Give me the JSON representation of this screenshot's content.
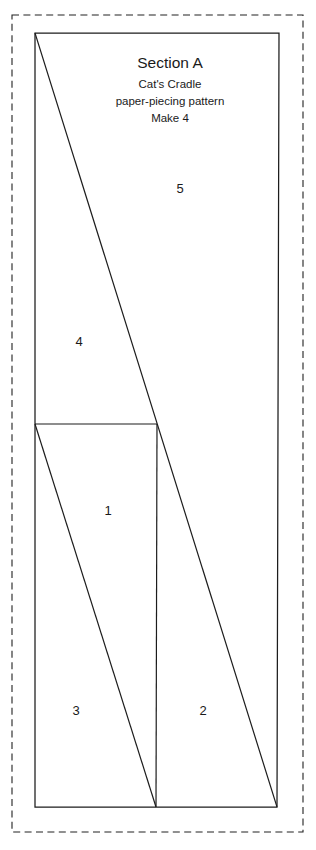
{
  "sheet": {
    "width": 316,
    "height": 850,
    "background_color": "#ffffff",
    "line_color": "#1c1c1c",
    "seam_color": "#222222"
  },
  "title_block": {
    "section": "Section A",
    "pattern_name": "Cat's Cradle",
    "pattern_type": "paper-piecing pattern",
    "make_count": "Make 4"
  },
  "pieces": [
    {
      "label": "1",
      "x": 108,
      "y": 512
    },
    {
      "label": "2",
      "x": 203,
      "y": 712
    },
    {
      "label": "3",
      "x": 76,
      "y": 712
    },
    {
      "label": "4",
      "x": 79,
      "y": 343
    },
    {
      "label": "5",
      "x": 180,
      "y": 190
    }
  ],
  "geometry": {
    "seam_allowance_rect": {
      "x": 12,
      "y": 15,
      "width": 291,
      "height": 817
    },
    "outline_points": "35,33 279,33 277,807 35,807",
    "horizontal_divider": {
      "x1": 35,
      "y1": 424,
      "x2": 157,
      "y2": 424
    },
    "long_diagonal": {
      "x1": 35,
      "y1": 33,
      "x2": 277,
      "y2": 807
    },
    "lower_diagonal": {
      "x1": 35,
      "y1": 424,
      "x2": 156,
      "y2": 807
    },
    "vertical_divider": {
      "x1": 157,
      "y1": 424,
      "x2": 156,
      "y2": 807
    }
  },
  "title_positions": {
    "section_x": 170,
    "section_y": 63,
    "name_x": 170,
    "name_y": 84,
    "type_x": 170,
    "type_y": 101,
    "make_x": 170,
    "make_y": 118
  }
}
